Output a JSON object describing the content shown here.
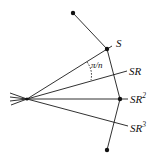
{
  "diagram": {
    "labels": {
      "s": "S",
      "sr": "SR",
      "sr2_base": "SR",
      "sr2_exp": "2",
      "sr3_base": "SR",
      "sr3_exp": "3",
      "angle": "π/n"
    },
    "colors": {
      "stroke": "#1a1a1a",
      "background": "#ffffff"
    }
  }
}
